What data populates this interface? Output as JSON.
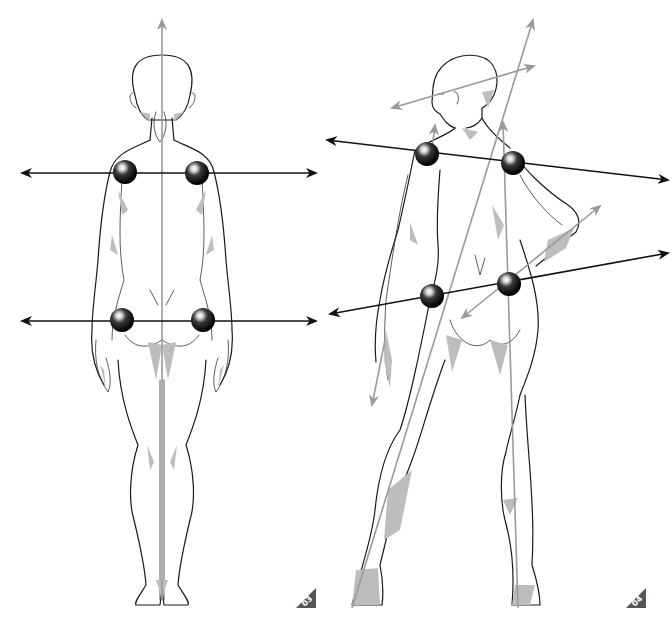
{
  "figures": [
    {
      "id": "figure-03",
      "label": "03",
      "pose": "back view, standing straight",
      "lines": {
        "central_axis": {
          "color": "#9a9a9a",
          "direction": "vertical"
        },
        "shoulder_line": {
          "color": "#111111",
          "direction": "horizontal"
        },
        "hip_line": {
          "color": "#111111",
          "direction": "horizontal"
        }
      },
      "markers": [
        "left-shoulder",
        "right-shoulder",
        "left-hip",
        "right-hip"
      ]
    },
    {
      "id": "figure-04",
      "label": "04",
      "pose": "back view, contrapposto with hand on hip, head turned",
      "lines": {
        "shoulder_line": {
          "color": "#111111",
          "direction": "tilted down to right"
        },
        "hip_line": {
          "color": "#111111",
          "direction": "tilted up to right"
        },
        "head_axis": {
          "color": "#9a9a9a"
        },
        "body_axis": {
          "color": "#9a9a9a"
        },
        "supporting_leg_axis": {
          "color": "#9a9a9a"
        },
        "arm_axis": {
          "color": "#9a9a9a"
        }
      },
      "markers": [
        "left-shoulder",
        "right-shoulder",
        "left-hip",
        "right-hip"
      ]
    }
  ],
  "colors": {
    "background": "#ffffff",
    "outline": "#1a1a1a",
    "shading": "#bdbdbd",
    "axis_gray": "#9a9a9a",
    "axis_black": "#111111",
    "label_tag": "#555555"
  }
}
